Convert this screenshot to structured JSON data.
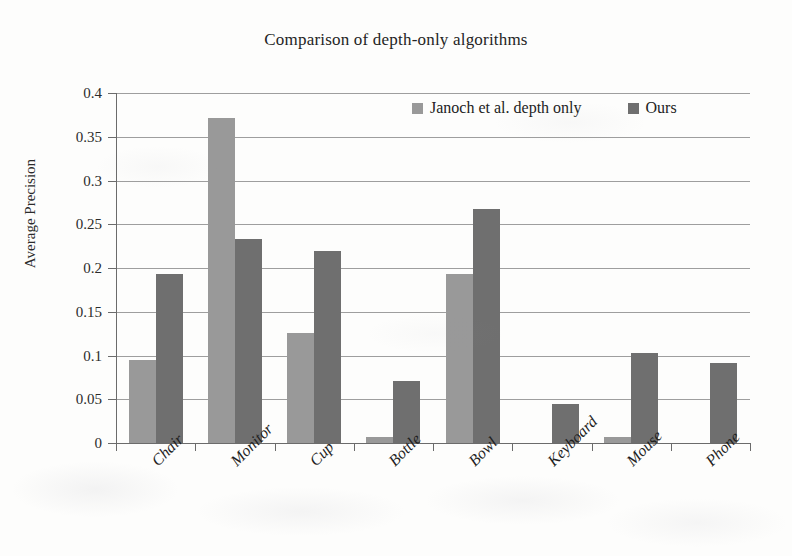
{
  "chart_data": {
    "type": "bar",
    "title": "Comparison of depth-only algorithms",
    "xlabel": "",
    "ylabel": "Average Precision",
    "categories": [
      "Chair",
      "Monitor",
      "Cup",
      "Bottle",
      "Bowl",
      "Keyboard",
      "Mouse",
      "Phone"
    ],
    "series": [
      {
        "name": "Janoch et al. depth only",
        "color": "#999999",
        "values": [
          0.095,
          0.371,
          0.126,
          0.007,
          0.193,
          0.0,
          0.007,
          0.0
        ]
      },
      {
        "name": "Ours",
        "color": "#6f6f6f",
        "values": [
          0.193,
          0.233,
          0.22,
          0.071,
          0.267,
          0.045,
          0.103,
          0.091
        ]
      }
    ],
    "ylim": [
      0,
      0.4
    ],
    "ytick_values": [
      0,
      0.05,
      0.1,
      0.15,
      0.2,
      0.25,
      0.3,
      0.35,
      0.4
    ],
    "ytick_labels": [
      "0",
      "0.05",
      "0.1",
      "0.15",
      "0.2",
      "0.25",
      "0.3",
      "0.35",
      "0.4"
    ],
    "grid": true,
    "legend_position": "top-right-inside"
  }
}
